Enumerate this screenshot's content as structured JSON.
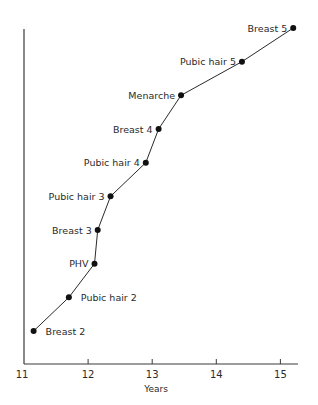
{
  "chart_data": {
    "type": "line",
    "title": "",
    "xlabel": "Years",
    "ylabel": "",
    "xlim": [
      11,
      15.25
    ],
    "x_ticks": [
      11,
      12,
      13,
      14,
      15
    ],
    "x_tick_labels": [
      "11",
      "12",
      "13",
      "14",
      "15"
    ],
    "grid": false,
    "legend": null,
    "line_color": "#2a2a2a",
    "marker_color": "#111111",
    "points": [
      {
        "label": "Breast 2",
        "x": 11.15,
        "rank": 1,
        "label_side": "right"
      },
      {
        "label": "Pubic hair 2",
        "x": 11.7,
        "rank": 2,
        "label_side": "right"
      },
      {
        "label": "PHV",
        "x": 12.1,
        "rank": 3,
        "label_side": "left"
      },
      {
        "label": "Breast 3",
        "x": 12.15,
        "rank": 4,
        "label_side": "left"
      },
      {
        "label": "Pubic hair 3",
        "x": 12.35,
        "rank": 5,
        "label_side": "left"
      },
      {
        "label": "Pubic hair 4",
        "x": 12.9,
        "rank": 6,
        "label_side": "left"
      },
      {
        "label": "Breast 4",
        "x": 13.1,
        "rank": 7,
        "label_side": "left"
      },
      {
        "label": "Menarche",
        "x": 13.45,
        "rank": 8,
        "label_side": "left"
      },
      {
        "label": "Pubic hair 5",
        "x": 14.4,
        "rank": 9,
        "label_side": "left"
      },
      {
        "label": "Breast 5",
        "x": 15.2,
        "rank": 10,
        "label_side": "left"
      }
    ]
  }
}
